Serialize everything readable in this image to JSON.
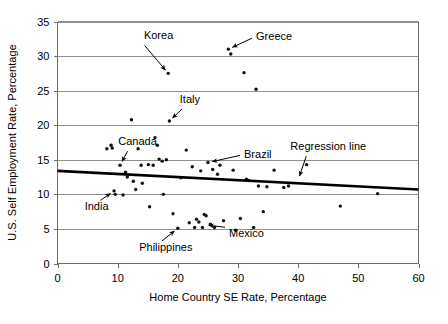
{
  "chart_data": {
    "type": "scatter",
    "title": "",
    "xlabel": "Home Country SE Rate, Percentage",
    "ylabel": "U.S. Self Employment Rate, Percentage",
    "xlim": [
      0,
      60
    ],
    "ylim": [
      0,
      35
    ],
    "xticks": [
      0,
      10,
      20,
      30,
      40,
      50,
      60
    ],
    "yticks": [
      0,
      5,
      10,
      15,
      20,
      25,
      30,
      35
    ],
    "grid": "horizontal",
    "legend": "none",
    "points": [
      {
        "x": 8.2,
        "y": 16.6
      },
      {
        "x": 8.9,
        "y": 17.1
      },
      {
        "x": 9.1,
        "y": 16.7
      },
      {
        "x": 9.4,
        "y": 10.5
      },
      {
        "x": 9.6,
        "y": 10.0
      },
      {
        "x": 10.4,
        "y": 14.2
      },
      {
        "x": 10.9,
        "y": 9.9
      },
      {
        "x": 11.3,
        "y": 13.2
      },
      {
        "x": 11.6,
        "y": 12.5
      },
      {
        "x": 12.3,
        "y": 20.8
      },
      {
        "x": 12.6,
        "y": 11.9
      },
      {
        "x": 13.0,
        "y": 10.7
      },
      {
        "x": 13.4,
        "y": 16.6
      },
      {
        "x": 13.9,
        "y": 14.2
      },
      {
        "x": 14.1,
        "y": 11.6
      },
      {
        "x": 15.1,
        "y": 14.3
      },
      {
        "x": 15.3,
        "y": 8.2
      },
      {
        "x": 15.9,
        "y": 14.2
      },
      {
        "x": 16.2,
        "y": 18.2
      },
      {
        "x": 16.6,
        "y": 17.1
      },
      {
        "x": 16.9,
        "y": 15.1
      },
      {
        "x": 17.4,
        "y": 14.8
      },
      {
        "x": 17.6,
        "y": 10.0
      },
      {
        "x": 18.1,
        "y": 15.0
      },
      {
        "x": 18.6,
        "y": 20.6
      },
      {
        "x": 19.2,
        "y": 7.2
      },
      {
        "x": 20.0,
        "y": 5.1
      },
      {
        "x": 20.5,
        "y": 12.4
      },
      {
        "x": 21.4,
        "y": 16.4
      },
      {
        "x": 21.9,
        "y": 5.9
      },
      {
        "x": 22.4,
        "y": 14.0
      },
      {
        "x": 22.8,
        "y": 5.2
      },
      {
        "x": 23.1,
        "y": 6.4
      },
      {
        "x": 23.5,
        "y": 6.0
      },
      {
        "x": 23.8,
        "y": 13.4
      },
      {
        "x": 24.1,
        "y": 5.2
      },
      {
        "x": 24.4,
        "y": 7.1
      },
      {
        "x": 24.7,
        "y": 6.9
      },
      {
        "x": 25.0,
        "y": 14.6
      },
      {
        "x": 25.4,
        "y": 5.7
      },
      {
        "x": 25.8,
        "y": 13.6
      },
      {
        "x": 26.1,
        "y": 5.2
      },
      {
        "x": 26.6,
        "y": 12.9
      },
      {
        "x": 27.0,
        "y": 14.2
      },
      {
        "x": 27.6,
        "y": 6.2
      },
      {
        "x": 28.4,
        "y": 31.0
      },
      {
        "x": 28.8,
        "y": 30.3
      },
      {
        "x": 29.2,
        "y": 13.5
      },
      {
        "x": 29.6,
        "y": 4.8
      },
      {
        "x": 30.4,
        "y": 6.5
      },
      {
        "x": 31.0,
        "y": 27.6
      },
      {
        "x": 31.4,
        "y": 12.2
      },
      {
        "x": 31.8,
        "y": 12.0
      },
      {
        "x": 32.6,
        "y": 5.2
      },
      {
        "x": 33.0,
        "y": 25.2
      },
      {
        "x": 33.4,
        "y": 11.2
      },
      {
        "x": 34.2,
        "y": 7.5
      },
      {
        "x": 34.8,
        "y": 11.1
      },
      {
        "x": 36.0,
        "y": 13.5
      },
      {
        "x": 37.6,
        "y": 11.0
      },
      {
        "x": 38.4,
        "y": 11.2
      },
      {
        "x": 41.4,
        "y": 14.3
      },
      {
        "x": 47.0,
        "y": 8.3
      },
      {
        "x": 53.2,
        "y": 10.1
      },
      {
        "x": 18.4,
        "y": 27.5
      }
    ],
    "labelled_points": {
      "Korea": {
        "x": 18.4,
        "y": 27.5
      },
      "Greece": {
        "x": 28.4,
        "y": 31.0
      },
      "Italy": {
        "x": 18.6,
        "y": 20.6
      },
      "Canada": {
        "x": 10.4,
        "y": 14.2
      },
      "Brazil": {
        "x": 25.0,
        "y": 14.6
      },
      "India": {
        "x": 9.4,
        "y": 10.5
      },
      "Philippines": {
        "x": 20.0,
        "y": 5.1
      },
      "Mexico": {
        "x": 24.4,
        "y": 5.6
      }
    },
    "regression_line": {
      "label": "Regression line",
      "x_start": 0,
      "y_start": 13.4,
      "x_end": 60,
      "y_end": 10.7
    },
    "annotations": [
      {
        "text": "Korea",
        "label_x": 16.8,
        "label_y": 32.4
      },
      {
        "text": "Greece",
        "label_x": 33.0,
        "label_y": 32.3
      },
      {
        "text": "Italy",
        "label_x": 22.0,
        "label_y": 23.2
      },
      {
        "text": "Canada",
        "label_x": 13.3,
        "label_y": 17.1
      },
      {
        "text": "Brazil",
        "label_x": 31.0,
        "label_y": 15.2
      },
      {
        "text": "Regression line",
        "label_x": 45.0,
        "label_y": 16.4
      },
      {
        "text": "India",
        "label_x": 6.5,
        "label_y": 7.7
      },
      {
        "text": "Philippines",
        "label_x": 18.0,
        "label_y": 1.8
      },
      {
        "text": "Mexico",
        "label_x": 28.5,
        "label_y": 3.8
      }
    ]
  }
}
